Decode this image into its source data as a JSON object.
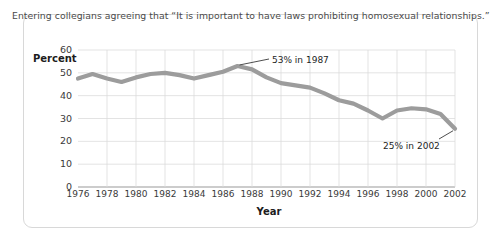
{
  "card": {
    "title": "Entering collegians agreeing that “It is important to have laws prohibiting homosexual relationships.”"
  },
  "chart_data": {
    "type": "line",
    "title": "Entering collegians agreeing that “It is important to have laws prohibiting homosexual relationships.”",
    "xlabel": "Year",
    "ylabel": "Percent",
    "xlim": [
      1976,
      2002
    ],
    "ylim": [
      0,
      60
    ],
    "yticks": [
      0,
      10,
      20,
      30,
      40,
      50,
      60
    ],
    "xticks": [
      1976,
      1978,
      1980,
      1982,
      1984,
      1986,
      1988,
      1990,
      1992,
      1994,
      1996,
      1998,
      2000,
      2002
    ],
    "grid": true,
    "legend": null,
    "line_color": "#9c9c9c",
    "series": [
      {
        "name": "Percent agreeing",
        "x": [
          1976,
          1977,
          1978,
          1979,
          1980,
          1981,
          1982,
          1983,
          1984,
          1985,
          1986,
          1987,
          1988,
          1989,
          1990,
          1991,
          1992,
          1993,
          1994,
          1995,
          1996,
          1997,
          1998,
          1999,
          2000,
          2001,
          2002
        ],
        "values": [
          47.5,
          49.5,
          47.5,
          46.0,
          48.0,
          49.5,
          50.0,
          49.0,
          47.5,
          49.0,
          50.5,
          53.0,
          51.5,
          48.0,
          45.5,
          44.5,
          43.5,
          41.0,
          38.0,
          36.5,
          33.5,
          30.0,
          33.5,
          34.5,
          34.0,
          32.0,
          25.5
        ]
      }
    ],
    "annotations": [
      {
        "text": "53% in 1987",
        "year": 1987,
        "value": 53
      },
      {
        "text": "25% in 2002",
        "year": 2002,
        "value": 25
      }
    ]
  },
  "axis": {
    "y_ticks": [
      "60",
      "50",
      "40",
      "30",
      "20",
      "10",
      "0"
    ],
    "x_ticks": [
      "1976",
      "1978",
      "1980",
      "1982",
      "1984",
      "1986",
      "1988",
      "1990",
      "1992",
      "1994",
      "1996",
      "1998",
      "2000",
      "2002"
    ],
    "y_title": "Percent",
    "x_title": "Year"
  },
  "annotations": {
    "peak": "53% in 1987",
    "end": "25% in 2002"
  }
}
